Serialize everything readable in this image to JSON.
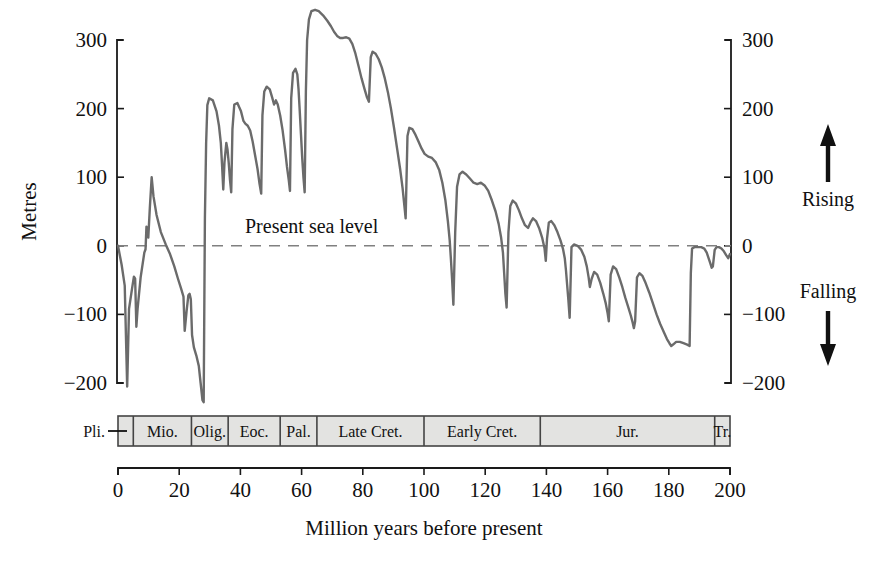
{
  "chart_data": {
    "type": "line",
    "title": "",
    "xlabel": "Million years before present",
    "ylabel": "Metres",
    "xlim": [
      0,
      200
    ],
    "ylim": [
      -230,
      345
    ],
    "x_reversed": false,
    "grid": false,
    "legend": null,
    "xticks": [
      0,
      20,
      40,
      60,
      80,
      100,
      120,
      140,
      160,
      180,
      200
    ],
    "xtick_labels": [
      "0",
      "20",
      "40",
      "60",
      "80",
      "100",
      "120",
      "140",
      "160",
      "180",
      "200"
    ],
    "yticks": [
      300,
      200,
      100,
      0,
      -100,
      -200
    ],
    "ytick_labels": [
      "300",
      "200",
      "100",
      "0",
      "−100",
      "−200"
    ],
    "ytick_labels_right": [
      "300",
      "200",
      "100",
      "0",
      "−100",
      "−200"
    ],
    "series_name": "Global sea level (Vail curve)",
    "line_color": "#6b6b6b",
    "line_width": 2.4,
    "reference_line": {
      "value": 0,
      "label": "Present sea level",
      "style": "dashed",
      "color": "#808080"
    },
    "direction_markers": [
      {
        "label": "Rising",
        "arrow": "up"
      },
      {
        "label": "Falling",
        "arrow": "down"
      }
    ],
    "points": [
      [
        0,
        0
      ],
      [
        1.2,
        -28
      ],
      [
        2.2,
        -58
      ],
      [
        3.0,
        -205
      ],
      [
        3.6,
        -92
      ],
      [
        4.6,
        -62
      ],
      [
        5.2,
        -45
      ],
      [
        5.6,
        -48
      ],
      [
        6.0,
        -118
      ],
      [
        6.4,
        -92
      ],
      [
        7.4,
        -46
      ],
      [
        8.6,
        -10
      ],
      [
        9.0,
        -5
      ],
      [
        9.3,
        28
      ],
      [
        9.6,
        18
      ],
      [
        9.9,
        12
      ],
      [
        10.4,
        55
      ],
      [
        11.0,
        100
      ],
      [
        11.6,
        72
      ],
      [
        12.6,
        45
      ],
      [
        14.0,
        20
      ],
      [
        15.6,
        2
      ],
      [
        17.0,
        -12
      ],
      [
        18.4,
        -30
      ],
      [
        19.6,
        -48
      ],
      [
        20.6,
        -62
      ],
      [
        21.4,
        -74
      ],
      [
        21.8,
        -124
      ],
      [
        22.4,
        -96
      ],
      [
        23.0,
        -72
      ],
      [
        23.4,
        -70
      ],
      [
        23.8,
        -78
      ],
      [
        24.2,
        -130
      ],
      [
        24.8,
        -148
      ],
      [
        25.6,
        -160
      ],
      [
        26.4,
        -175
      ],
      [
        27.0,
        -200
      ],
      [
        27.6,
        -225
      ],
      [
        28.0,
        -228
      ],
      [
        28.4,
        40
      ],
      [
        28.8,
        150
      ],
      [
        29.2,
        205
      ],
      [
        29.8,
        215
      ],
      [
        31.0,
        212
      ],
      [
        32.2,
        196
      ],
      [
        33.0,
        175
      ],
      [
        33.6,
        150
      ],
      [
        34.0,
        118
      ],
      [
        34.4,
        82
      ],
      [
        34.8,
        122
      ],
      [
        35.4,
        150
      ],
      [
        35.8,
        140
      ],
      [
        36.2,
        120
      ],
      [
        36.6,
        96
      ],
      [
        37.0,
        78
      ],
      [
        37.4,
        170
      ],
      [
        38.0,
        206
      ],
      [
        39.0,
        208
      ],
      [
        40.2,
        196
      ],
      [
        41.0,
        182
      ],
      [
        41.6,
        178
      ],
      [
        42.4,
        175
      ],
      [
        43.2,
        168
      ],
      [
        44.0,
        152
      ],
      [
        44.8,
        132
      ],
      [
        45.6,
        112
      ],
      [
        46.2,
        92
      ],
      [
        46.8,
        76
      ],
      [
        47.2,
        190
      ],
      [
        47.8,
        225
      ],
      [
        48.6,
        232
      ],
      [
        49.6,
        228
      ],
      [
        50.4,
        216
      ],
      [
        51.0,
        206
      ],
      [
        51.6,
        212
      ],
      [
        52.2,
        206
      ],
      [
        53.0,
        190
      ],
      [
        53.8,
        168
      ],
      [
        54.6,
        140
      ],
      [
        55.2,
        116
      ],
      [
        55.8,
        96
      ],
      [
        56.2,
        80
      ],
      [
        56.6,
        215
      ],
      [
        57.2,
        252
      ],
      [
        58.0,
        258
      ],
      [
        58.6,
        250
      ],
      [
        59.0,
        228
      ],
      [
        59.4,
        196
      ],
      [
        59.8,
        162
      ],
      [
        60.2,
        128
      ],
      [
        60.6,
        100
      ],
      [
        61.0,
        78
      ],
      [
        61.4,
        225
      ],
      [
        61.8,
        300
      ],
      [
        62.4,
        330
      ],
      [
        63.2,
        342
      ],
      [
        64.4,
        344
      ],
      [
        65.6,
        342
      ],
      [
        67.0,
        336
      ],
      [
        68.4,
        328
      ],
      [
        69.6,
        320
      ],
      [
        70.6,
        312
      ],
      [
        71.6,
        306
      ],
      [
        72.6,
        303
      ],
      [
        73.6,
        303
      ],
      [
        74.6,
        304
      ],
      [
        75.6,
        302
      ],
      [
        76.6,
        294
      ],
      [
        77.6,
        280
      ],
      [
        78.6,
        262
      ],
      [
        79.6,
        244
      ],
      [
        80.6,
        228
      ],
      [
        81.4,
        216
      ],
      [
        82.0,
        210
      ],
      [
        82.6,
        275
      ],
      [
        83.2,
        283
      ],
      [
        84.2,
        280
      ],
      [
        85.2,
        272
      ],
      [
        86.2,
        260
      ],
      [
        87.2,
        244
      ],
      [
        88.2,
        224
      ],
      [
        89.2,
        200
      ],
      [
        90.2,
        172
      ],
      [
        91.2,
        142
      ],
      [
        92.2,
        112
      ],
      [
        93.0,
        84
      ],
      [
        93.6,
        58
      ],
      [
        94.0,
        40
      ],
      [
        94.6,
        160
      ],
      [
        95.2,
        172
      ],
      [
        96.2,
        170
      ],
      [
        97.2,
        162
      ],
      [
        98.2,
        152
      ],
      [
        99.2,
        142
      ],
      [
        100.2,
        134
      ],
      [
        101.4,
        130
      ],
      [
        102.6,
        128
      ],
      [
        103.8,
        122
      ],
      [
        105.0,
        110
      ],
      [
        106.0,
        92
      ],
      [
        107.0,
        66
      ],
      [
        107.8,
        36
      ],
      [
        108.4,
        8
      ],
      [
        108.8,
        -20
      ],
      [
        109.2,
        -50
      ],
      [
        109.6,
        -86
      ],
      [
        110.2,
        20
      ],
      [
        110.8,
        86
      ],
      [
        111.6,
        104
      ],
      [
        112.6,
        108
      ],
      [
        113.8,
        104
      ],
      [
        115.0,
        98
      ],
      [
        116.2,
        92
      ],
      [
        117.4,
        90
      ],
      [
        118.6,
        92
      ],
      [
        119.8,
        88
      ],
      [
        121.0,
        80
      ],
      [
        122.2,
        66
      ],
      [
        123.4,
        50
      ],
      [
        124.4,
        32
      ],
      [
        125.2,
        12
      ],
      [
        125.8,
        -10
      ],
      [
        126.2,
        -40
      ],
      [
        126.6,
        -70
      ],
      [
        127.0,
        -90
      ],
      [
        127.6,
        20
      ],
      [
        128.2,
        58
      ],
      [
        129.0,
        66
      ],
      [
        130.0,
        62
      ],
      [
        131.0,
        52
      ],
      [
        132.0,
        40
      ],
      [
        133.0,
        30
      ],
      [
        134.0,
        26
      ],
      [
        134.8,
        34
      ],
      [
        135.6,
        40
      ],
      [
        136.6,
        36
      ],
      [
        137.6,
        26
      ],
      [
        138.6,
        12
      ],
      [
        139.4,
        -4
      ],
      [
        139.8,
        -22
      ],
      [
        140.2,
        10
      ],
      [
        140.8,
        34
      ],
      [
        141.6,
        36
      ],
      [
        142.6,
        30
      ],
      [
        143.6,
        20
      ],
      [
        144.6,
        8
      ],
      [
        145.4,
        -4
      ],
      [
        146.0,
        -18
      ],
      [
        146.4,
        -36
      ],
      [
        146.8,
        -58
      ],
      [
        147.2,
        -80
      ],
      [
        147.6,
        -105
      ],
      [
        148.2,
        -2
      ],
      [
        149.0,
        2
      ],
      [
        150.2,
        0
      ],
      [
        151.4,
        -6
      ],
      [
        152.4,
        -16
      ],
      [
        153.2,
        -30
      ],
      [
        153.8,
        -46
      ],
      [
        154.2,
        -60
      ],
      [
        154.8,
        -48
      ],
      [
        155.6,
        -38
      ],
      [
        156.6,
        -42
      ],
      [
        157.6,
        -54
      ],
      [
        158.6,
        -70
      ],
      [
        159.4,
        -84
      ],
      [
        160.0,
        -98
      ],
      [
        160.4,
        -110
      ],
      [
        161.0,
        -42
      ],
      [
        161.8,
        -30
      ],
      [
        162.8,
        -34
      ],
      [
        163.8,
        -46
      ],
      [
        164.8,
        -60
      ],
      [
        165.8,
        -76
      ],
      [
        166.8,
        -90
      ],
      [
        167.6,
        -102
      ],
      [
        168.2,
        -112
      ],
      [
        168.6,
        -120
      ],
      [
        169.0,
        -110
      ],
      [
        169.6,
        -46
      ],
      [
        170.4,
        -40
      ],
      [
        171.4,
        -44
      ],
      [
        172.4,
        -54
      ],
      [
        173.6,
        -68
      ],
      [
        174.8,
        -84
      ],
      [
        176.0,
        -100
      ],
      [
        177.2,
        -114
      ],
      [
        178.4,
        -126
      ],
      [
        179.4,
        -136
      ],
      [
        180.2,
        -142
      ],
      [
        180.8,
        -146
      ],
      [
        181.4,
        -144
      ],
      [
        182.4,
        -140
      ],
      [
        183.6,
        -140
      ],
      [
        184.8,
        -142
      ],
      [
        186.0,
        -144
      ],
      [
        186.8,
        -146
      ],
      [
        187.2,
        -40
      ],
      [
        187.6,
        -4
      ],
      [
        188.4,
        -2
      ],
      [
        189.6,
        -2
      ],
      [
        190.6,
        -2
      ],
      [
        191.6,
        -4
      ],
      [
        192.4,
        -10
      ],
      [
        193.0,
        -18
      ],
      [
        193.6,
        -26
      ],
      [
        194.0,
        -32
      ],
      [
        194.4,
        -30
      ],
      [
        195.0,
        -6
      ],
      [
        195.6,
        -2
      ],
      [
        196.4,
        -2
      ],
      [
        197.2,
        -4
      ],
      [
        198.0,
        -8
      ],
      [
        198.8,
        -14
      ],
      [
        199.4,
        -18
      ],
      [
        200.0,
        -12
      ]
    ],
    "periods": [
      {
        "label": "Pli.",
        "start": 0,
        "end": 5,
        "external_label": true
      },
      {
        "label": "Mio.",
        "start": 5,
        "end": 24
      },
      {
        "label": "Olig.",
        "start": 24,
        "end": 36
      },
      {
        "label": "Eoc.",
        "start": 36,
        "end": 53
      },
      {
        "label": "Pal.",
        "start": 53,
        "end": 65
      },
      {
        "label": "Late Cret.",
        "start": 65,
        "end": 100
      },
      {
        "label": "Early Cret.",
        "start": 100,
        "end": 138
      },
      {
        "label": "Jur.",
        "start": 138,
        "end": 195
      },
      {
        "label": "Tr.",
        "start": 195,
        "end": 200
      }
    ],
    "period_band_fill": "#e3e3e1",
    "period_band_stroke": "#444444"
  }
}
